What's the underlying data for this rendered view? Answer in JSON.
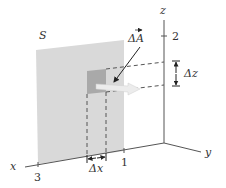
{
  "diagram": {
    "surface_label": "S",
    "area_vector_label": "ΔA⃗",
    "area_vector_base": "ΔA",
    "axes": {
      "x_label": "x",
      "y_label": "y",
      "z_label": "z",
      "x_tick": "3",
      "y_tick": "1",
      "z_tick": "2"
    },
    "delta_x_label": "Δx",
    "delta_z_label": "Δz"
  },
  "colors": {
    "surface": "#d9d9d9",
    "patch": "#a9a9a9",
    "normal_arrow": "#e6e6e6",
    "axis": "#555555",
    "dashed": "#555555",
    "text": "#333333"
  }
}
